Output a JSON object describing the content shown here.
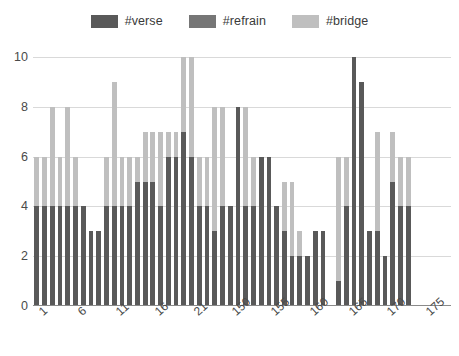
{
  "chart_data": {
    "type": "bar",
    "stacked": true,
    "title": "",
    "subtitle": "",
    "xlabel": "",
    "ylabel": "",
    "ylim": [
      0,
      10
    ],
    "y_ticks": [
      0,
      2,
      4,
      6,
      8,
      10
    ],
    "grid": true,
    "legend_position": "top-center",
    "legend": [
      "#verse",
      "#refrain",
      "#bridge"
    ],
    "colors": {
      "#verse": "#595959",
      "#refrain": "#767676",
      "#bridge": "#bfbfbf",
      "gridline": "#d9d9d9",
      "axis": "#8a8a8a",
      "text": "#4a4a4a",
      "background": "#ffffff"
    },
    "x_tick_labels": [
      "1",
      "6",
      "11",
      "16",
      "21",
      "150",
      "155",
      "160",
      "165",
      "170",
      "175"
    ],
    "x_tick_indices": [
      0,
      5,
      10,
      15,
      20,
      25,
      30,
      35,
      40,
      45,
      50
    ],
    "categories": [
      "1",
      "2",
      "3",
      "4",
      "5",
      "6",
      "7",
      "8",
      "9",
      "10",
      "11",
      "12",
      "13",
      "14",
      "15",
      "16",
      "17",
      "18",
      "19",
      "20",
      "21",
      "22",
      "23",
      "24",
      "25",
      "26",
      "27",
      "28",
      "29",
      "30",
      "31",
      "32",
      "33",
      "34",
      "35",
      "36",
      "37",
      "38",
      "39",
      "40",
      "41",
      "42",
      "43",
      "44",
      "45",
      "46",
      "47",
      "48",
      "49",
      "50",
      "51",
      "52",
      "53",
      "54"
    ],
    "series": [
      {
        "name": "#verse",
        "values": [
          4,
          4,
          4,
          4,
          4,
          4,
          4,
          3,
          3,
          4,
          4,
          4,
          4,
          5,
          5,
          5,
          4,
          6,
          6,
          7,
          6,
          4,
          4,
          3,
          4,
          4,
          8,
          4,
          4,
          6,
          6,
          4,
          3,
          2,
          2,
          2,
          3,
          3,
          0,
          1,
          4,
          10,
          9,
          3,
          3,
          2,
          5,
          4,
          4,
          0,
          0,
          0,
          0,
          0
        ]
      },
      {
        "name": "#refrain",
        "values": [
          0,
          0,
          0,
          0,
          0,
          0,
          0,
          0,
          0,
          0,
          0,
          0,
          0,
          0,
          0,
          0,
          0,
          0,
          0,
          0,
          0,
          0,
          0,
          0,
          0,
          0,
          0,
          0,
          0,
          0,
          0,
          0,
          0,
          0,
          0,
          0,
          0,
          0,
          0,
          0,
          0,
          0,
          0,
          0,
          0,
          0,
          0,
          0,
          0,
          0,
          0,
          0,
          0,
          0
        ]
      },
      {
        "name": "#bridge",
        "values": [
          2,
          2,
          4,
          2,
          4,
          2,
          0,
          0,
          0,
          2,
          5,
          2,
          2,
          1,
          2,
          2,
          3,
          1,
          1,
          3,
          4,
          2,
          2,
          5,
          4,
          0,
          0,
          4,
          2,
          0,
          0,
          0,
          2,
          3,
          1,
          0,
          0,
          0,
          0,
          5,
          2,
          0,
          0,
          0,
          4,
          0,
          2,
          2,
          2,
          0,
          0,
          0,
          0,
          0
        ]
      }
    ],
    "totals": [
      6,
      6,
      8,
      6,
      8,
      6,
      4,
      3,
      3,
      6,
      9,
      6,
      6,
      6,
      7,
      7,
      7,
      7,
      7,
      10,
      10,
      6,
      6,
      8,
      8,
      4,
      8,
      8,
      6,
      6,
      6,
      4,
      5,
      5,
      3,
      2,
      3,
      3,
      0,
      6,
      6,
      10,
      9,
      3,
      7,
      2,
      7,
      6,
      6,
      0,
      0,
      0,
      0,
      0
    ]
  }
}
